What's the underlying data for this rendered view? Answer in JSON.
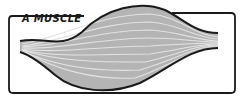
{
  "figure": {
    "label": "A MUSCLE",
    "colors": {
      "outline": "#1a1a1a",
      "fill": "#b4b4b4",
      "fiber": "#e0e0e0",
      "background": "#ffffff"
    }
  }
}
